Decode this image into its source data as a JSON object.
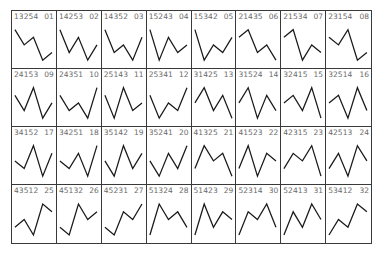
{
  "figure": {
    "rows": 4,
    "columns": 8,
    "line_color": "#1a1a1a",
    "label_color": "#6a6a6a",
    "border_color": "#3a3a3a",
    "caption": ""
  },
  "chart_data": {
    "type": "line",
    "title": "",
    "panels": [
      {
        "code": "13254",
        "index": "01",
        "ranks": [
          1,
          3,
          2,
          5,
          4
        ]
      },
      {
        "code": "14253",
        "index": "02",
        "ranks": [
          1,
          4,
          2,
          5,
          3
        ]
      },
      {
        "code": "14352",
        "index": "03",
        "ranks": [
          1,
          4,
          3,
          5,
          2
        ]
      },
      {
        "code": "15243",
        "index": "04",
        "ranks": [
          1,
          5,
          2,
          4,
          3
        ]
      },
      {
        "code": "15342",
        "index": "05",
        "ranks": [
          1,
          5,
          3,
          4,
          2
        ]
      },
      {
        "code": "21435",
        "index": "06",
        "ranks": [
          2,
          1,
          4,
          3,
          5
        ]
      },
      {
        "code": "21534",
        "index": "07",
        "ranks": [
          2,
          1,
          5,
          3,
          4
        ]
      },
      {
        "code": "23154",
        "index": "08",
        "ranks": [
          2,
          3,
          1,
          5,
          4
        ]
      },
      {
        "code": "24153",
        "index": "09",
        "ranks": [
          2,
          4,
          1,
          5,
          3
        ]
      },
      {
        "code": "24351",
        "index": "10",
        "ranks": [
          2,
          4,
          3,
          5,
          1
        ]
      },
      {
        "code": "25143",
        "index": "11",
        "ranks": [
          2,
          5,
          1,
          4,
          3
        ]
      },
      {
        "code": "25341",
        "index": "12",
        "ranks": [
          2,
          5,
          3,
          4,
          1
        ]
      },
      {
        "code": "31425",
        "index": "13",
        "ranks": [
          3,
          1,
          4,
          2,
          5
        ]
      },
      {
        "code": "31524",
        "index": "14",
        "ranks": [
          3,
          1,
          5,
          2,
          4
        ]
      },
      {
        "code": "32415",
        "index": "15",
        "ranks": [
          3,
          2,
          4,
          1,
          5
        ]
      },
      {
        "code": "32514",
        "index": "16",
        "ranks": [
          3,
          2,
          5,
          1,
          4
        ]
      },
      {
        "code": "34152",
        "index": "17",
        "ranks": [
          3,
          4,
          1,
          5,
          2
        ]
      },
      {
        "code": "34251",
        "index": "18",
        "ranks": [
          3,
          4,
          2,
          5,
          1
        ]
      },
      {
        "code": "35142",
        "index": "19",
        "ranks": [
          3,
          5,
          1,
          4,
          2
        ]
      },
      {
        "code": "35241",
        "index": "20",
        "ranks": [
          3,
          5,
          2,
          4,
          1
        ]
      },
      {
        "code": "41325",
        "index": "21",
        "ranks": [
          4,
          1,
          3,
          2,
          5
        ]
      },
      {
        "code": "41523",
        "index": "22",
        "ranks": [
          4,
          1,
          5,
          2,
          3
        ]
      },
      {
        "code": "42315",
        "index": "23",
        "ranks": [
          4,
          2,
          3,
          1,
          5
        ]
      },
      {
        "code": "42513",
        "index": "24",
        "ranks": [
          4,
          2,
          5,
          1,
          3
        ]
      },
      {
        "code": "43512",
        "index": "25",
        "ranks": [
          4,
          3,
          5,
          1,
          2
        ]
      },
      {
        "code": "45132",
        "index": "26",
        "ranks": [
          4,
          5,
          1,
          3,
          2
        ]
      },
      {
        "code": "45231",
        "index": "27",
        "ranks": [
          4,
          5,
          2,
          3,
          1
        ]
      },
      {
        "code": "51324",
        "index": "28",
        "ranks": [
          5,
          1,
          3,
          2,
          4
        ]
      },
      {
        "code": "51423",
        "index": "29",
        "ranks": [
          5,
          1,
          4,
          2,
          3
        ]
      },
      {
        "code": "52314",
        "index": "30",
        "ranks": [
          5,
          2,
          3,
          1,
          4
        ]
      },
      {
        "code": "52413",
        "index": "31",
        "ranks": [
          5,
          2,
          4,
          1,
          3
        ]
      },
      {
        "code": "53412",
        "index": "32",
        "ranks": [
          5,
          3,
          4,
          1,
          2
        ]
      }
    ]
  }
}
